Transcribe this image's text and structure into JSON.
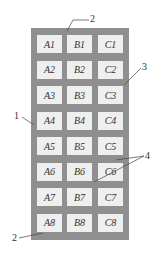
{
  "diagram": {
    "type": "grid-layout",
    "grid": {
      "columns": [
        "A",
        "B",
        "C"
      ],
      "rows": 8,
      "cells": [
        [
          "A1",
          "B1",
          "C1"
        ],
        [
          "A2",
          "B2",
          "C2"
        ],
        [
          "A3",
          "B3",
          "C3"
        ],
        [
          "A4",
          "B4",
          "C4"
        ],
        [
          "A5",
          "B5",
          "C5"
        ],
        [
          "A6",
          "B6",
          "C6"
        ],
        [
          "A7",
          "B7",
          "C7"
        ],
        [
          "A8",
          "B8",
          "C8"
        ]
      ]
    },
    "callouts": [
      {
        "id": "label-2-top",
        "text": "2"
      },
      {
        "id": "label-3",
        "text": "3"
      },
      {
        "id": "label-1",
        "text": "1"
      },
      {
        "id": "label-4",
        "text": "4"
      },
      {
        "id": "label-2-bottom",
        "text": "2"
      }
    ],
    "colors": {
      "panel": "#8f8f8f",
      "cell": "#efefef",
      "text": "#333333"
    }
  }
}
